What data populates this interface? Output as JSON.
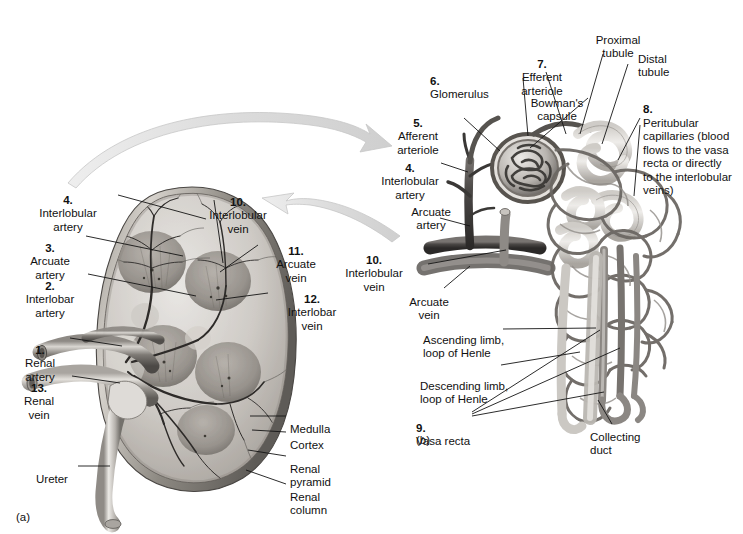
{
  "figure": {
    "panels": [
      {
        "tag": "(a)",
        "name": "kidney-frontal-section"
      },
      {
        "tag": "(b)",
        "name": "nephron-blood-supply"
      }
    ],
    "style": {
      "ink": "#111111",
      "leader": "#1a1a1a",
      "arrow_fill": "#d8d8d8",
      "arrow_stroke": "#c0c0c0"
    }
  },
  "panel_a": {
    "tag": "(a)",
    "labels": [
      {
        "num": "4.",
        "text": "Interlobular\nartery"
      },
      {
        "num": "3.",
        "text": "Arcuate\nartery"
      },
      {
        "num": "2.",
        "text": "Interlobar\nartery"
      },
      {
        "num": "1.",
        "text": "Renal\nartery"
      },
      {
        "num": "13.",
        "text": "Renal\nvein"
      },
      {
        "num": "",
        "text": "Ureter"
      },
      {
        "num": "10.",
        "text": "Interlobular\nvein"
      },
      {
        "num": "11.",
        "text": "Arcuate\nvein"
      },
      {
        "num": "12.",
        "text": "Interlobar\nvein"
      },
      {
        "num": "",
        "text": "Medulla"
      },
      {
        "num": "",
        "text": "Cortex"
      },
      {
        "num": "",
        "text": "Renal\npyramid"
      },
      {
        "num": "",
        "text": "Renal\ncolumn"
      }
    ]
  },
  "panel_b": {
    "tag": "(b)",
    "labels": [
      {
        "num": "5.",
        "text": "Afferent\narteriole"
      },
      {
        "num": "6.",
        "text": "Glomerulus"
      },
      {
        "num": "7.",
        "text": "Efferent\narteriole"
      },
      {
        "num": "",
        "text": "Bowman's\ncapsule"
      },
      {
        "num": "",
        "text": "Proximal\ntubule"
      },
      {
        "num": "",
        "text": "Distal\ntubule"
      },
      {
        "num": "8.",
        "text": "Peritubular\ncapillaries (blood\nflows to the vasa\nrecta or directly\nto the interlobular\nveins)"
      },
      {
        "num": "4.",
        "text": "Interlobular\nartery"
      },
      {
        "num": "",
        "text": "Arcuate\nartery"
      },
      {
        "num": "10.",
        "text": "Interlobular\nvein"
      },
      {
        "num": "",
        "text": "Arcuate\nvein"
      },
      {
        "num": "",
        "text": "Ascending limb,\nloop of Henle"
      },
      {
        "num": "",
        "text": "Descending limb,\nloop of Henle"
      },
      {
        "num": "9.",
        "text": "Vasa recta"
      },
      {
        "num": "",
        "text": "Collecting\nduct"
      }
    ]
  },
  "label_text": {
    "a_interlobular_artery": "Interlobular\nartery",
    "a_interlobular_artery_num": "4.",
    "a_arcuate_artery": "Arcuate\nartery",
    "a_arcuate_artery_num": "3.",
    "a_interlobar_artery": "Interlobar\nartery",
    "a_interlobar_artery_num": "2.",
    "a_renal_artery": "Renal\nartery",
    "a_renal_artery_num": "1.",
    "a_renal_vein": "Renal\nvein",
    "a_renal_vein_num": "13.",
    "a_ureter": "Ureter",
    "a_interlobular_vein": "Interlobular\nvein",
    "a_interlobular_vein_num": "10.",
    "a_arcuate_vein": "Arcuate\nvein",
    "a_arcuate_vein_num": "11.",
    "a_interlobar_vein": "Interlobar\nvein",
    "a_interlobar_vein_num": "12.",
    "a_medulla": "Medulla",
    "a_cortex": "Cortex",
    "a_renal_pyramid": "Renal\npyramid",
    "a_renal_column": "Renal\ncolumn",
    "a_tag": "(a)",
    "b_afferent_arteriole": "Afferent\narteriole",
    "b_afferent_arteriole_num": "5.",
    "b_glomerulus": "Glomerulus",
    "b_glomerulus_num": "6.",
    "b_efferent_arteriole": "Efferent\narteriole",
    "b_efferent_arteriole_num": "7.",
    "b_bowmans_capsule": "Bowman's\ncapsule",
    "b_proximal_tubule": "Proximal\ntubule",
    "b_distal_tubule": "Distal\ntubule",
    "b_peritubular": "Peritubular\ncapillaries (blood\nflows to the vasa\nrecta or directly\nto the interlobular\nveins)",
    "b_peritubular_num": "8.",
    "b_interlobular_artery": "Interlobular\nartery",
    "b_interlobular_artery_num": "4.",
    "b_arcuate_artery": "Arcuate\nartery",
    "b_interlobular_vein": "Interlobular\nvein",
    "b_interlobular_vein_num": "10.",
    "b_arcuate_vein": "Arcuate\nvein",
    "b_ascending_limb": "Ascending limb,\nloop of Henle",
    "b_descending_limb": "Descending limb,\nloop of Henle",
    "b_vasa_recta": "Vasa recta",
    "b_vasa_recta_num": "9.",
    "b_collecting_duct": "Collecting\nduct",
    "b_tag": "(b)"
  }
}
